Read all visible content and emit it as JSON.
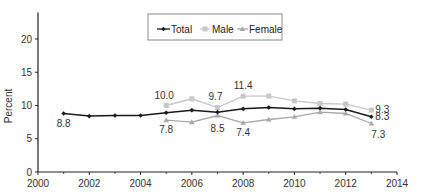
{
  "chart_data": {
    "type": "line",
    "title": "",
    "xlabel": "",
    "ylabel": "Percent",
    "xlim": [
      2000,
      2014
    ],
    "ylim": [
      0,
      24
    ],
    "x_ticks": [
      2000,
      2002,
      2004,
      2006,
      2008,
      2010,
      2012,
      2014
    ],
    "x_minor_ticks": [
      2001,
      2003,
      2005,
      2007,
      2009,
      2011,
      2013
    ],
    "y_ticks": [
      0,
      5,
      10,
      15,
      20
    ],
    "grid": false,
    "legend_position": "top-center",
    "series": [
      {
        "name": "Total",
        "color": "#1a1a1a",
        "marker": "diamond",
        "x": [
          2001,
          2002,
          2003,
          2004,
          2005,
          2006,
          2007,
          2008,
          2009,
          2010,
          2011,
          2012,
          2013
        ],
        "values": [
          8.8,
          8.4,
          8.5,
          8.5,
          8.9,
          9.3,
          9.0,
          9.5,
          9.7,
          9.5,
          9.6,
          9.4,
          8.3
        ]
      },
      {
        "name": "Male",
        "color": "#c8c8c8",
        "marker": "square",
        "x": [
          2005,
          2006,
          2007,
          2008,
          2009,
          2010,
          2011,
          2012,
          2013
        ],
        "values": [
          10.0,
          11.0,
          9.7,
          11.4,
          11.4,
          10.7,
          10.3,
          10.2,
          9.3
        ]
      },
      {
        "name": "Female",
        "color": "#a8a8a8",
        "marker": "triangle",
        "x": [
          2005,
          2006,
          2007,
          2008,
          2009,
          2010,
          2011,
          2012,
          2013
        ],
        "values": [
          7.8,
          7.5,
          8.5,
          7.4,
          7.9,
          8.3,
          9.0,
          8.8,
          7.3
        ]
      }
    ],
    "annotations": [
      {
        "text": "8.8",
        "x": 2001,
        "y": 8.8,
        "series": "Total"
      },
      {
        "text": "10.0",
        "x": 2005,
        "y": 10.0,
        "series": "Male"
      },
      {
        "text": "7.8",
        "x": 2005,
        "y": 7.8,
        "series": "Female"
      },
      {
        "text": "9.7",
        "x": 2007,
        "y": 9.7,
        "series": "Male"
      },
      {
        "text": "8.5",
        "x": 2007,
        "y": 8.5,
        "series": "Female"
      },
      {
        "text": "11.4",
        "x": 2008,
        "y": 11.4,
        "series": "Male"
      },
      {
        "text": "7.4",
        "x": 2008,
        "y": 7.4,
        "series": "Female"
      },
      {
        "text": "9.3",
        "x": 2013,
        "y": 9.3,
        "series": "Male"
      },
      {
        "text": "8.3",
        "x": 2013,
        "y": 8.3,
        "series": "Total"
      },
      {
        "text": "7.3",
        "x": 2013,
        "y": 7.3,
        "series": "Female"
      }
    ]
  },
  "legend": {
    "items": [
      {
        "label": "Total"
      },
      {
        "label": "Male"
      },
      {
        "label": "Female"
      }
    ]
  },
  "axes": {
    "ylabel": "Percent"
  }
}
